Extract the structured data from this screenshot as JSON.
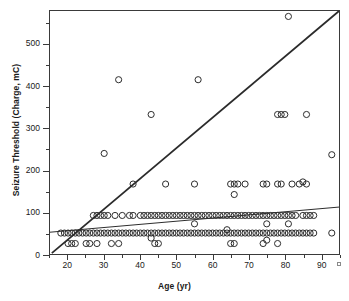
{
  "figure": {
    "background": "#ffffff",
    "frame_color": "#3a3a3a",
    "marker_color": "#2b2b2b",
    "line_color": "#2b2b2b"
  },
  "axes": {
    "x_title": "Age (yr)",
    "y_title": "Seizure Threshold (Charge, mC)",
    "x_ticks": [
      "20",
      "30",
      "40",
      "50",
      "60",
      "70",
      "80",
      "90"
    ],
    "y_ticks": [
      "0",
      "100",
      "200",
      "300",
      "400",
      "500"
    ]
  },
  "chart_data": {
    "type": "scatter",
    "title": "",
    "xlabel": "Age (yr)",
    "ylabel": "Seizure Threshold (Charge, mC)",
    "xlim": [
      15,
      95
    ],
    "ylim": [
      0,
      580
    ],
    "x_ticks": [
      20,
      30,
      40,
      50,
      60,
      70,
      80,
      90
    ],
    "y_ticks": [
      0,
      100,
      200,
      300,
      400,
      500
    ],
    "x_minor_step": 5,
    "y_minor_step": 50,
    "grid": false,
    "legend": null,
    "marker": "open-circle",
    "series": [
      {
        "name": "Patients",
        "points": [
          [
            18,
            50
          ],
          [
            19,
            50
          ],
          [
            20,
            25
          ],
          [
            20,
            50
          ],
          [
            21,
            25
          ],
          [
            21,
            50
          ],
          [
            22,
            25
          ],
          [
            22,
            50
          ],
          [
            23,
            50
          ],
          [
            24,
            50
          ],
          [
            25,
            25
          ],
          [
            25,
            50
          ],
          [
            26,
            25
          ],
          [
            26,
            50
          ],
          [
            27,
            50
          ],
          [
            27,
            92
          ],
          [
            28,
            25
          ],
          [
            28,
            50
          ],
          [
            28,
            92
          ],
          [
            29,
            50
          ],
          [
            29,
            92
          ],
          [
            30,
            50
          ],
          [
            30,
            92
          ],
          [
            30,
            240
          ],
          [
            31,
            50
          ],
          [
            31,
            92
          ],
          [
            32,
            25
          ],
          [
            32,
            50
          ],
          [
            33,
            50
          ],
          [
            33,
            92
          ],
          [
            34,
            25
          ],
          [
            34,
            50
          ],
          [
            34,
            416
          ],
          [
            35,
            50
          ],
          [
            35,
            92
          ],
          [
            36,
            50
          ],
          [
            37,
            50
          ],
          [
            37,
            92
          ],
          [
            38,
            50
          ],
          [
            38,
            167
          ],
          [
            38,
            92
          ],
          [
            39,
            50
          ],
          [
            40,
            50
          ],
          [
            40,
            92
          ],
          [
            41,
            50
          ],
          [
            41,
            92
          ],
          [
            42,
            50
          ],
          [
            42,
            92
          ],
          [
            43,
            38
          ],
          [
            43,
            50
          ],
          [
            43,
            92
          ],
          [
            43,
            333
          ],
          [
            44,
            50
          ],
          [
            44,
            92
          ],
          [
            44,
            25
          ],
          [
            45,
            25
          ],
          [
            45,
            50
          ],
          [
            45,
            92
          ],
          [
            46,
            50
          ],
          [
            46,
            92
          ],
          [
            47,
            50
          ],
          [
            47,
            92
          ],
          [
            47,
            167
          ],
          [
            48,
            50
          ],
          [
            48,
            92
          ],
          [
            49,
            50
          ],
          [
            49,
            92
          ],
          [
            50,
            50
          ],
          [
            50,
            92
          ],
          [
            51,
            50
          ],
          [
            51,
            92
          ],
          [
            52,
            50
          ],
          [
            52,
            92
          ],
          [
            53,
            50
          ],
          [
            53,
            92
          ],
          [
            54,
            50
          ],
          [
            54,
            92
          ],
          [
            55,
            50
          ],
          [
            55,
            72
          ],
          [
            55,
            92
          ],
          [
            55,
            167
          ],
          [
            56,
            50
          ],
          [
            56,
            92
          ],
          [
            56,
            416
          ],
          [
            57,
            50
          ],
          [
            57,
            92
          ],
          [
            58,
            50
          ],
          [
            58,
            92
          ],
          [
            59,
            50
          ],
          [
            59,
            92
          ],
          [
            60,
            50
          ],
          [
            60,
            92
          ],
          [
            61,
            50
          ],
          [
            61,
            92
          ],
          [
            62,
            50
          ],
          [
            62,
            92
          ],
          [
            63,
            50
          ],
          [
            63,
            92
          ],
          [
            64,
            50
          ],
          [
            64,
            58
          ],
          [
            64,
            92
          ],
          [
            65,
            25
          ],
          [
            65,
            50
          ],
          [
            65,
            92
          ],
          [
            65,
            167
          ],
          [
            66,
            25
          ],
          [
            66,
            50
          ],
          [
            66,
            92
          ],
          [
            66,
            167
          ],
          [
            66,
            142
          ],
          [
            67,
            50
          ],
          [
            67,
            92
          ],
          [
            67,
            167
          ],
          [
            68,
            50
          ],
          [
            68,
            92
          ],
          [
            69,
            50
          ],
          [
            69,
            92
          ],
          [
            69,
            167
          ],
          [
            70,
            50
          ],
          [
            70,
            92
          ],
          [
            71,
            50
          ],
          [
            71,
            92
          ],
          [
            72,
            50
          ],
          [
            72,
            92
          ],
          [
            73,
            50
          ],
          [
            73,
            92
          ],
          [
            74,
            25
          ],
          [
            74,
            50
          ],
          [
            74,
            92
          ],
          [
            74,
            167
          ],
          [
            75,
            33
          ],
          [
            75,
            50
          ],
          [
            75,
            72
          ],
          [
            75,
            92
          ],
          [
            75,
            167
          ],
          [
            76,
            50
          ],
          [
            76,
            92
          ],
          [
            77,
            50
          ],
          [
            77,
            92
          ],
          [
            78,
            25
          ],
          [
            78,
            50
          ],
          [
            78,
            92
          ],
          [
            78,
            167
          ],
          [
            78,
            333
          ],
          [
            79,
            50
          ],
          [
            79,
            92
          ],
          [
            79,
            167
          ],
          [
            79,
            333
          ],
          [
            80,
            50
          ],
          [
            80,
            92
          ],
          [
            80,
            333
          ],
          [
            81,
            50
          ],
          [
            81,
            72
          ],
          [
            81,
            92
          ],
          [
            81,
            567
          ],
          [
            82,
            50
          ],
          [
            82,
            92
          ],
          [
            82,
            167
          ],
          [
            83,
            50
          ],
          [
            83,
            92
          ],
          [
            84,
            50
          ],
          [
            84,
            167
          ],
          [
            85,
            50
          ],
          [
            85,
            92
          ],
          [
            85,
            172
          ],
          [
            86,
            50
          ],
          [
            86,
            92
          ],
          [
            86,
            167
          ],
          [
            86,
            333
          ],
          [
            87,
            50
          ],
          [
            87,
            92
          ],
          [
            88,
            50
          ],
          [
            88,
            92
          ],
          [
            93,
            50
          ],
          [
            93,
            237
          ]
        ]
      }
    ],
    "fit_lines": [
      {
        "name": "steep-reference-line",
        "x_from": 15.5,
        "y_from": 2,
        "x_to": 95,
        "y_to": 580,
        "width": 1.8
      },
      {
        "name": "shallow-regression-line",
        "x_from": 15,
        "y_from": 52,
        "x_to": 95,
        "y_to": 112,
        "width": 1.0
      }
    ]
  }
}
